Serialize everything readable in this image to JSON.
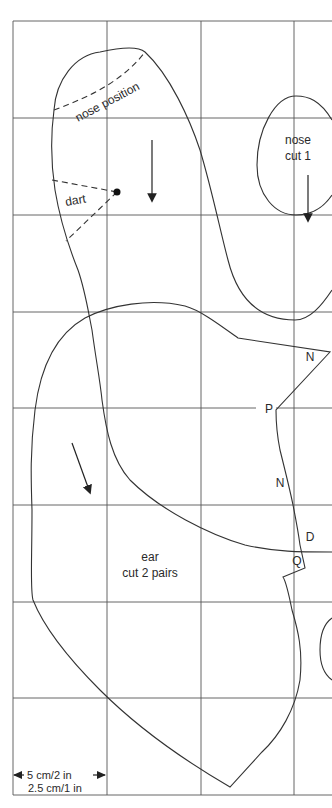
{
  "diagram": {
    "type": "sewing pattern on grid",
    "grid": {
      "scale_label_cm_in": "5 cm/2 in",
      "scale_label_small": "2.5 cm/1 in",
      "x_lines": [
        13,
        107,
        201,
        294
      ],
      "y_lines": [
        21,
        118,
        215,
        312,
        408,
        505,
        602,
        698,
        795
      ]
    },
    "pieces": {
      "head": {
        "label_nose_position": "nose position",
        "label_dart": "dart"
      },
      "nose": {
        "label_line1": "nose",
        "label_line2": "cut 1"
      },
      "ear": {
        "label_line1": "ear",
        "label_line2": "cut 2 pairs"
      }
    },
    "markers": {
      "n_top": "N",
      "p": "P",
      "n_mid": "N",
      "d": "D",
      "q": "Q"
    },
    "colors": {
      "line": "#333333",
      "grid": "#555555",
      "background": "#ffffff"
    }
  }
}
